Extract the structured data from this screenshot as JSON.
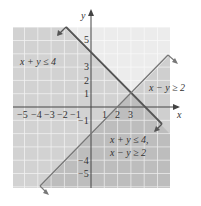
{
  "axes": {
    "x_label": "x",
    "y_label": "y",
    "x_ticks": [
      "−5",
      "−4",
      "−3",
      "−2",
      "−1",
      "1",
      "2",
      "3"
    ],
    "y_ticks_pos": [
      "5",
      "4",
      "3",
      "2",
      "1"
    ],
    "y_ticks_neg": [
      "−1",
      "−4",
      "−5"
    ]
  },
  "regions": {
    "region1_label": "x + y ≤ 4",
    "region2_label": "x − y ≥ 2",
    "intersection_line1": "x + y ≤ 4,",
    "intersection_line2": "x − y ≥ 2"
  },
  "colors": {
    "background": "#ffffff",
    "shade": "#d4d4d4",
    "double_shade": "#bdbdbd",
    "grid": "#f2f2f2",
    "line_boundary": "#555555",
    "axis": "#444444"
  }
}
